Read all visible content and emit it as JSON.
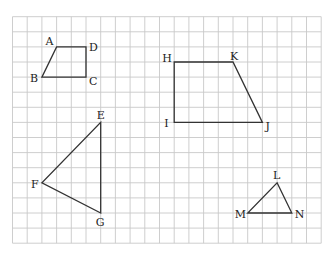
{
  "header": {
    "partial_text": "▔▔ ▔ ▔ ▔ ▔ ▔ ▔ ▔"
  },
  "grid": {
    "x0": 12.5,
    "y0": 16.7,
    "cols": 21,
    "rows": 15,
    "cell_w": 14.7,
    "cell_h": 15.1,
    "line_color": "#c8c8c8"
  },
  "shapes": [
    {
      "name": "quadrilateral-ABCD",
      "vertices": [
        {
          "label": "A",
          "col": 3,
          "row": 2,
          "dx": -11,
          "dy": -2
        },
        {
          "label": "D",
          "col": 5,
          "row": 2,
          "dx": 3,
          "dy": 4
        },
        {
          "label": "C",
          "col": 5,
          "row": 4,
          "dx": 3,
          "dy": 8
        },
        {
          "label": "B",
          "col": 2,
          "row": 4,
          "dx": -12,
          "dy": 5
        }
      ]
    },
    {
      "name": "quadrilateral-HKJI",
      "vertices": [
        {
          "label": "H",
          "col": 11,
          "row": 3,
          "dx": -12,
          "dy": 0
        },
        {
          "label": "K",
          "col": 15,
          "row": 3,
          "dx": -3,
          "dy": -2
        },
        {
          "label": "J",
          "col": 17,
          "row": 7,
          "dx": 3,
          "dy": 8
        },
        {
          "label": "I",
          "col": 11,
          "row": 7,
          "dx": -10,
          "dy": 5
        }
      ]
    },
    {
      "name": "triangle-EFG",
      "vertices": [
        {
          "label": "E",
          "col": 6,
          "row": 7,
          "dx": -4,
          "dy": -3
        },
        {
          "label": "G",
          "col": 6,
          "row": 13,
          "dx": -5,
          "dy": 13
        },
        {
          "label": "F",
          "col": 2,
          "row": 11,
          "dx": -11,
          "dy": 5
        }
      ]
    },
    {
      "name": "triangle-LMN",
      "vertices": [
        {
          "label": "L",
          "col": 18,
          "row": 11,
          "dx": -4,
          "dy": -4
        },
        {
          "label": "N",
          "col": 19,
          "row": 13,
          "dx": 3,
          "dy": 5
        },
        {
          "label": "M",
          "col": 16,
          "row": 13,
          "dx": -13,
          "dy": 5
        }
      ]
    }
  ],
  "colors": {
    "stroke": "#333333",
    "label": "#222222"
  }
}
